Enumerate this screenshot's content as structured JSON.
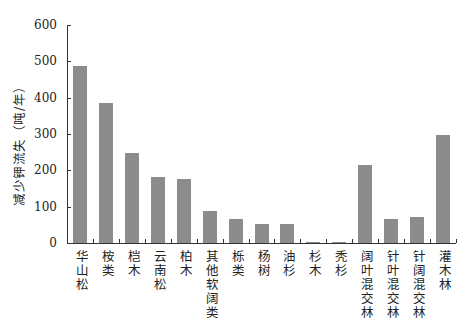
{
  "chart_data": {
    "type": "bar",
    "title": "",
    "xlabel": "",
    "ylabel": "减少钾流失（吨/年）",
    "ylim": [
      0,
      600
    ],
    "yticks": [
      0,
      100,
      200,
      300,
      400,
      500,
      600
    ],
    "grid": false,
    "legend": null,
    "bar_color": "#8c8c8c",
    "categories": [
      "华山松",
      "桉类",
      "桤木",
      "云南松",
      "柏木",
      "其他软阔类",
      "栎类",
      "杨树",
      "油杉",
      "杉木",
      "秃杉",
      "阔叶混交林",
      "针叶混交林",
      "针阔混交林",
      "灌木林"
    ],
    "values": [
      486,
      385,
      248,
      182,
      177,
      89,
      67,
      52,
      52,
      3,
      2,
      214,
      65,
      72,
      297
    ]
  }
}
